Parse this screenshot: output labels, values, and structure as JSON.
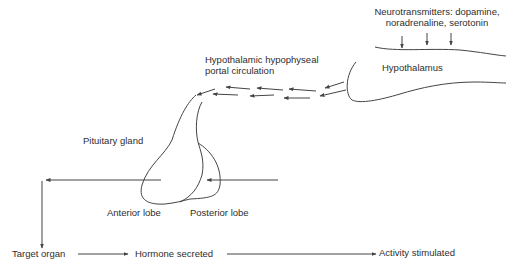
{
  "diagram": {
    "labels": {
      "neurotransmitters_line1": "Neurotransmitters: dopamine,",
      "neurotransmitters_line2": "noradrenaline, serotonin",
      "hypothalamus": "Hypothalamus",
      "portal_line1": "Hypothalamic hypophyseal",
      "portal_line2": "portal circulation",
      "pituitary_gland": "Pituitary gland",
      "anterior_lobe": "Anterior lobe",
      "posterior_lobe": "Posterior lobe",
      "target_organ": "Target organ",
      "hormone_secreted": "Hormone secreted",
      "activity_stimulated": "Activity stimulated"
    },
    "flow": [
      {
        "from": "Neurotransmitters",
        "to": "Hypothalamus"
      },
      {
        "from": "Hypothalamus",
        "to": "Pituitary gland",
        "via": "Hypothalamic hypophyseal portal circulation"
      },
      {
        "from": "Anterior lobe",
        "to": "Target organ"
      },
      {
        "from": "Target organ",
        "to": "Hormone secreted"
      },
      {
        "from": "Hormone secreted",
        "to": "Activity stimulated"
      }
    ],
    "colors": {
      "line": "#444444",
      "text": "#2e2e2e",
      "background": "#ffffff"
    }
  }
}
